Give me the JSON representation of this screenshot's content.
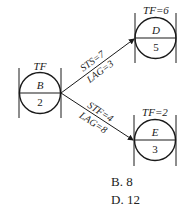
{
  "diagram": {
    "type": "precedence-network",
    "nodes": [
      {
        "id": "B",
        "tf_label": "TF",
        "name": "B",
        "duration": "2"
      },
      {
        "id": "D",
        "tf_label": "TF=6",
        "name": "D",
        "duration": "5"
      },
      {
        "id": "E",
        "tf_label": "TF=2",
        "name": "E",
        "duration": "3"
      }
    ],
    "edges": [
      {
        "from": "B",
        "to": "D",
        "relation": "STS=7",
        "lag": "LAG=3"
      },
      {
        "from": "B",
        "to": "E",
        "relation": "STF=4",
        "lag": "LAG=8"
      }
    ]
  },
  "options": [
    {
      "letter": "B.",
      "value": "8"
    },
    {
      "letter": "D.",
      "value": "12"
    }
  ],
  "colors": {
    "stroke": "#1a1a1a",
    "background": "#ffffff"
  }
}
